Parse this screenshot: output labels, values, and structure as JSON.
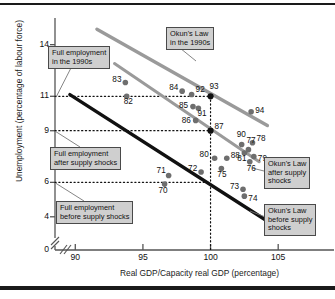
{
  "chart_data": {
    "type": "scatter",
    "title": "",
    "xlabel": "Real GDP/Capacity real GDP (percentage)",
    "ylabel": "Unemployment (percentage of labour force)",
    "xlim": [
      88.5,
      107.5
    ],
    "ylim": [
      0,
      15.2
    ],
    "xticks": [
      "90",
      "95",
      "100",
      "105"
    ],
    "xtick_values": [
      90,
      95,
      100,
      105
    ],
    "yticks": [
      "0",
      "4",
      "6",
      "9",
      "11",
      "14"
    ],
    "ytick_values": [
      0,
      4,
      6,
      9,
      11,
      14
    ],
    "axis_break_y": true,
    "grid": false,
    "reference_lines": {
      "horizontal_dotted": [
        11,
        9,
        6
      ],
      "vertical_dotted": [
        100
      ]
    },
    "points": [
      {
        "label": "70",
        "x": 96.6,
        "y": 5.9,
        "style": "grey"
      },
      {
        "label": "71",
        "x": 96.9,
        "y": 6.4,
        "style": "grey"
      },
      {
        "label": "72",
        "x": 99.3,
        "y": 6.6,
        "style": "grey"
      },
      {
        "label": "73",
        "x": 102.4,
        "y": 5.6,
        "style": "grey"
      },
      {
        "label": "74",
        "x": 102.5,
        "y": 5.2,
        "style": "grey"
      },
      {
        "label": "75",
        "x": 100.8,
        "y": 6.8,
        "style": "grey"
      },
      {
        "label": "76",
        "x": 102.9,
        "y": 7.2,
        "style": "grey"
      },
      {
        "label": "77",
        "x": 102.8,
        "y": 7.9,
        "style": "grey"
      },
      {
        "label": "78",
        "x": 103.1,
        "y": 8.3,
        "style": "grey"
      },
      {
        "label": "79",
        "x": 103.2,
        "y": 7.5,
        "style": "grey"
      },
      {
        "label": "80",
        "x": 100.3,
        "y": 7.4,
        "style": "grey"
      },
      {
        "label": "81",
        "x": 102.5,
        "y": 7.7,
        "style": "grey"
      },
      {
        "label": "82",
        "x": 93.8,
        "y": 11.0,
        "style": "grey"
      },
      {
        "label": "83",
        "x": 93.7,
        "y": 11.8,
        "style": "grey"
      },
      {
        "label": "84",
        "x": 97.9,
        "y": 11.3,
        "style": "grey"
      },
      {
        "label": "85",
        "x": 98.7,
        "y": 10.4,
        "style": "grey"
      },
      {
        "label": "86",
        "x": 98.9,
        "y": 9.6,
        "style": "grey"
      },
      {
        "label": "87",
        "x": 100.0,
        "y": 9.0,
        "style": "black"
      },
      {
        "label": "88",
        "x": 101.2,
        "y": 7.4,
        "style": "grey"
      },
      {
        "label": "90",
        "x": 102.3,
        "y": 8.2,
        "style": "grey"
      },
      {
        "label": "91",
        "x": 99.1,
        "y": 10.3,
        "style": "grey"
      },
      {
        "label": "92",
        "x": 98.6,
        "y": 11.1,
        "style": "grey"
      },
      {
        "label": "93",
        "x": 100.0,
        "y": 11.0,
        "style": "black"
      },
      {
        "label": "94",
        "x": 103.0,
        "y": 10.1,
        "style": "grey"
      }
    ],
    "lines": [
      {
        "name": "Okun's Law in the 1990s",
        "color": "#9a9a9a",
        "width": 3.4,
        "x1": 91.6,
        "y1": 14.9,
        "x2": 104.2,
        "y2": 9.3
      },
      {
        "name": "Okun's Law after supply shocks",
        "color": "#9a9a9a",
        "width": 3.0,
        "x1": 92.9,
        "y1": 12.9,
        "x2": 103.6,
        "y2": 7.2
      },
      {
        "name": "Okun's Law before supply shocks",
        "color": "#111111",
        "width": 3.4,
        "x1": 89.6,
        "y1": 11.1,
        "x2": 104.1,
        "y2": 3.8
      }
    ]
  },
  "annotations": {
    "full_employment_1990s": {
      "line1": "Full employment",
      "line2": "in the 1990s"
    },
    "okuns_law_1990s": {
      "line1": "Okun's Law",
      "line2": "in the 1990s"
    },
    "full_employment_after": {
      "line1": "Full employment",
      "line2": "after supply shocks"
    },
    "full_employment_before": {
      "line1": "Full employment",
      "line2": "before supply shocks"
    },
    "okuns_law_after": {
      "line1": "Okun's Law",
      "line2": "after supply",
      "line3": "shocks"
    },
    "okuns_law_before": {
      "line1": "Okun's Law",
      "line2": "before supply",
      "line3": "shocks"
    }
  },
  "colors": {
    "grey_line": "#9a9a9a",
    "black_line": "#111111",
    "point_grey": "#6e6e6e",
    "point_black": "#111111",
    "label_box_bg": "#cfcfcf",
    "label_box_border": "#4a4a4a"
  }
}
